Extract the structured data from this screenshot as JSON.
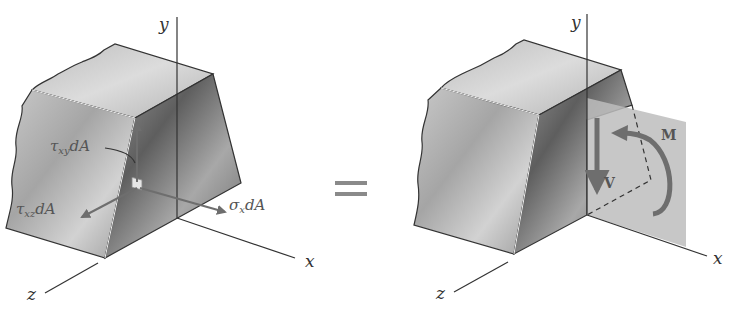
{
  "left_figure": {
    "axes": {
      "x": "x",
      "y": "y",
      "z": "z"
    },
    "forces": {
      "tau_xy": {
        "symbol": "τ",
        "subscript": "xy",
        "suffix": "dA"
      },
      "tau_xz": {
        "symbol": "τ",
        "subscript": "xz",
        "suffix": "dA"
      },
      "sigma_x": {
        "symbol": "σ",
        "subscript": "x",
        "suffix": "dA"
      }
    }
  },
  "equals_sign": "=",
  "right_figure": {
    "axes": {
      "x": "x",
      "y": "y",
      "z": "z"
    },
    "resultants": {
      "shear": "V",
      "moment": "M"
    }
  },
  "colors": {
    "block_light": "#cfcfcf",
    "block_dark": "#6f6f6f",
    "section_plane": "#bdbdbd",
    "arrow": "#6e6e6e",
    "axis_line": "#333333"
  }
}
